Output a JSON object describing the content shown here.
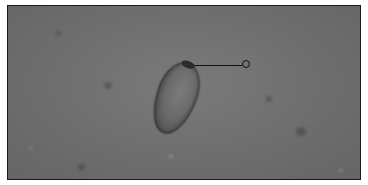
{
  "image": {
    "subject": "microscopy field with single ovoid specimen",
    "annotation": {
      "type": "leader-line-with-circle-marker",
      "label": ""
    },
    "colors": {
      "background": "#707070",
      "frame_border": "#1a1a1a",
      "annotation": "#111111"
    }
  }
}
